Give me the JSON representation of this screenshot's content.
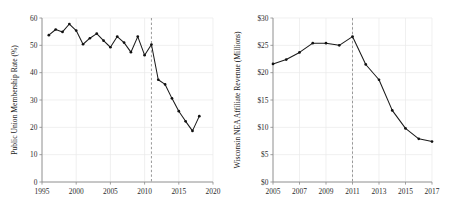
{
  "figure": {
    "name": "two-panel-line-figure",
    "background": "#ffffff",
    "line_color": "#1a1a1a",
    "grid_color": "#e9e9e9",
    "axis_color": "#8a8a8a",
    "event_line_color": "#8d8d8d"
  },
  "chart_data": [
    {
      "type": "line",
      "panel": "left",
      "title": "",
      "xlabel": "",
      "ylabel": "Public Union Membership Rate (%)",
      "xlim": [
        1995,
        2020
      ],
      "ylim": [
        0,
        60
      ],
      "xticks": [
        1995,
        2000,
        2005,
        2010,
        2015,
        2020
      ],
      "xtick_labels": [
        "1995",
        "2000",
        "2005",
        "2010",
        "2015",
        "2020"
      ],
      "yticks": [
        0,
        10,
        20,
        30,
        40,
        50,
        60
      ],
      "ytick_labels": [
        "0",
        "10",
        "20",
        "30",
        "40",
        "50",
        "60"
      ],
      "grid": true,
      "legend": "none",
      "annotations": [
        {
          "type": "vline",
          "x": 2011,
          "style": "dashed",
          "label": "Act 10 (2011)"
        }
      ],
      "x": [
        1996,
        1997,
        1998,
        1999,
        2000,
        2001,
        2002,
        2003,
        2004,
        2005,
        2006,
        2007,
        2008,
        2009,
        2010,
        2011,
        2012,
        2013,
        2014,
        2015,
        2016,
        2017,
        2018
      ],
      "values": [
        53.7,
        55.8,
        54.9,
        57.8,
        55.4,
        50.4,
        52.6,
        54.3,
        51.7,
        49.3,
        53.2,
        51.0,
        47.5,
        53.2,
        46.4,
        50.3,
        37.4,
        35.7,
        30.6,
        25.9,
        22.2,
        18.7,
        24.1
      ]
    },
    {
      "type": "line",
      "panel": "right",
      "title": "",
      "xlabel": "",
      "ylabel": "Wisconsin NEA Affiliate Revenue (Millions)",
      "xlim": [
        2005,
        2017
      ],
      "ylim": [
        0,
        30
      ],
      "xticks": [
        2005,
        2007,
        2009,
        2011,
        2013,
        2015,
        2017
      ],
      "xtick_labels": [
        "2005",
        "2007",
        "2009",
        "2011",
        "2013",
        "2015",
        "2017"
      ],
      "yticks": [
        0,
        5,
        10,
        15,
        20,
        25,
        30
      ],
      "ytick_labels": [
        "$0",
        "$5",
        "$10",
        "$15",
        "$20",
        "$25",
        "$30"
      ],
      "grid": true,
      "legend": "none",
      "annotations": [
        {
          "type": "vline",
          "x": 2011,
          "style": "dashed",
          "label": "Act 10 (2011)"
        }
      ],
      "x": [
        2005,
        2006,
        2007,
        2008,
        2009,
        2010,
        2011,
        2012,
        2013,
        2014,
        2015,
        2016,
        2017
      ],
      "values": [
        21.6,
        22.4,
        23.7,
        25.4,
        25.4,
        25.0,
        26.6,
        21.5,
        18.7,
        13.1,
        9.8,
        7.9,
        7.4
      ]
    }
  ]
}
